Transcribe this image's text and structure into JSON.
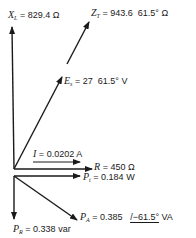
{
  "diagram": {
    "type": "phasor-diagram",
    "colors": {
      "stroke": "#1a1a1a",
      "background": "#ffffff"
    },
    "phasors": [
      {
        "id": "xl",
        "symbol": "X",
        "subscript": "L",
        "eq": "=",
        "value": "829.4",
        "angle": "",
        "unit": "Ω"
      },
      {
        "id": "zt",
        "symbol": "Z",
        "subscript": "T",
        "eq": "=",
        "value": "943.6",
        "angle": "61.5°",
        "unit": "Ω"
      },
      {
        "id": "es",
        "symbol": "E",
        "subscript": "s",
        "eq": "=",
        "value": "27",
        "angle": "61.5°",
        "unit": "V"
      },
      {
        "id": "i",
        "symbol": "I",
        "subscript": "",
        "eq": "=",
        "value": "0.0202",
        "angle": "",
        "unit": "A"
      },
      {
        "id": "r",
        "symbol": "R",
        "subscript": "",
        "eq": "=",
        "value": "450",
        "angle": "",
        "unit": "Ω"
      },
      {
        "id": "pt",
        "symbol": "P",
        "subscript": "t",
        "eq": "=",
        "value": "0.184",
        "angle": "",
        "unit": "W"
      },
      {
        "id": "pa",
        "symbol": "P",
        "subscript": "A",
        "eq": "=",
        "value": "0.385",
        "angle": "/−61.5°",
        "unit": "VA"
      },
      {
        "id": "pr",
        "symbol": "P",
        "subscript": "R",
        "eq": "=",
        "value": "0.338",
        "angle": "",
        "unit": "var"
      }
    ]
  }
}
